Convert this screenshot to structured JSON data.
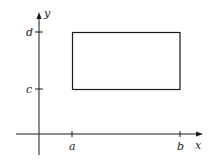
{
  "diagram": {
    "axes": {
      "x_label": "x",
      "y_label": "y"
    },
    "x_ticks": [
      {
        "id": "a",
        "label": "a"
      },
      {
        "id": "b",
        "label": "b"
      }
    ],
    "y_ticks": [
      {
        "id": "c",
        "label": "c"
      },
      {
        "id": "d",
        "label": "d"
      }
    ],
    "region": {
      "shape": "rectangle",
      "x_range": [
        "a",
        "b"
      ],
      "y_range": [
        "c",
        "d"
      ]
    },
    "colors": {
      "stroke": "#1a1a1a",
      "background": "#ffffff"
    }
  }
}
